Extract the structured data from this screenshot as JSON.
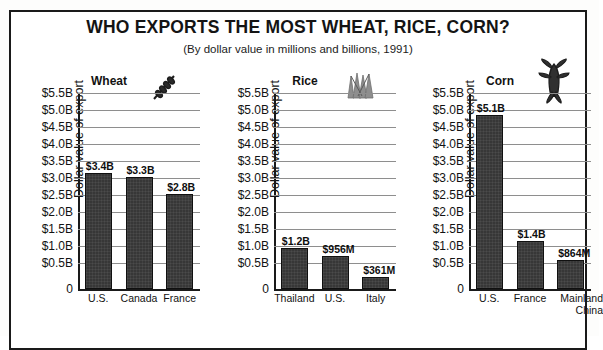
{
  "title": "WHO EXPORTS THE MOST WHEAT, RICE, CORN?",
  "subtitle": "(By dollar value in millions and billions, 1991)",
  "axis": {
    "ylabel": "Dollar value  of export",
    "ticks": [
      "$5.5B",
      "$5.0B",
      "$4.5B",
      "$4.0B",
      "$3.5B",
      "$3.0B",
      "$2.5B",
      "$2.0B",
      "$1.5B",
      "$1.0B",
      "$0.5B",
      "0"
    ]
  },
  "icons": {
    "wheat": "wheat-stalk-icon",
    "rice": "rice-sheaf-icon",
    "corn": "corn-cob-icon"
  },
  "chart_data": [
    {
      "type": "bar",
      "title": "Wheat",
      "xlabel": "",
      "ylabel": "Dollar value  of export",
      "ylim": [
        0,
        5.75
      ],
      "grid": true,
      "categories": [
        "U.S.",
        "Canada",
        "France"
      ],
      "values": [
        3.4,
        3.3,
        2.8
      ],
      "value_labels": [
        "$3.4B",
        "$3.3B",
        "$2.8B"
      ],
      "units": "billions of US dollars"
    },
    {
      "type": "bar",
      "title": "Rice",
      "xlabel": "",
      "ylabel": "Dollar value  of export",
      "ylim": [
        0,
        5.75
      ],
      "grid": true,
      "categories": [
        "Thailand",
        "U.S.",
        "Italy"
      ],
      "values": [
        1.2,
        0.956,
        0.361
      ],
      "value_labels": [
        "$1.2B",
        "$956M",
        "$361M"
      ],
      "units": "billions of US dollars"
    },
    {
      "type": "bar",
      "title": "Corn",
      "xlabel": "",
      "ylabel": "Dollar value  of export",
      "ylim": [
        0,
        5.75
      ],
      "grid": true,
      "categories": [
        "U.S.",
        "France",
        "Mainland China"
      ],
      "values": [
        5.1,
        1.4,
        0.864
      ],
      "value_labels": [
        "$5.1B",
        "$1.4B",
        "$864M"
      ],
      "units": "billions of US dollars"
    }
  ]
}
